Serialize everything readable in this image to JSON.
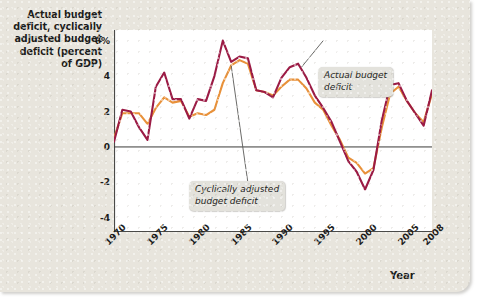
{
  "axes": {
    "y_title": "Actual budget deficit, cyclically adjusted budget deficit (percent of GDP)",
    "y_ticks": [
      "6%",
      "4",
      "2",
      "0",
      "-2",
      "-4"
    ],
    "x_title": "Year",
    "x_ticks": [
      "1970",
      "1975",
      "1980",
      "1985",
      "1990",
      "1995",
      "2000",
      "2005",
      "2008"
    ]
  },
  "annotations": {
    "actual": "Actual budget\ndeficit",
    "cyclical": "Cyclically adjusted\nbudget deficit"
  },
  "colors": {
    "actual": "#9B1B45",
    "cyclical": "#E8913A",
    "background": "#e8e5dd",
    "plot": "#ffffff",
    "axis": "#4a4a48",
    "callout_bg": "#e3e2dc",
    "text": "#1d1d1b"
  },
  "chart_data": {
    "type": "line",
    "title": "",
    "xlabel": "Year",
    "ylabel": "Actual budget deficit, cyclically adjusted budget deficit (percent of GDP)",
    "xlim": [
      1970,
      2008
    ],
    "ylim": [
      -4.8,
      6.6
    ],
    "yticks": [
      -4,
      -2,
      0,
      2,
      4,
      6
    ],
    "xticks": [
      1970,
      1975,
      1980,
      1985,
      1990,
      1995,
      2000,
      2005,
      2008
    ],
    "grid": false,
    "legend": "annotated-callouts",
    "x": [
      1970,
      1971,
      1972,
      1973,
      1974,
      1975,
      1976,
      1977,
      1978,
      1979,
      1980,
      1981,
      1982,
      1983,
      1984,
      1985,
      1986,
      1987,
      1988,
      1989,
      1990,
      1991,
      1992,
      1993,
      1994,
      1995,
      1996,
      1997,
      1998,
      1999,
      2000,
      2001,
      2002,
      2003,
      2004,
      2005,
      2006,
      2007,
      2008
    ],
    "series": [
      {
        "name": "Actual budget deficit",
        "color": "#9B1B45",
        "values": [
          0.3,
          2.1,
          2.0,
          1.1,
          0.4,
          3.4,
          4.2,
          2.7,
          2.7,
          1.6,
          2.7,
          2.6,
          4.0,
          6.0,
          4.8,
          5.1,
          5.0,
          3.2,
          3.1,
          2.8,
          3.9,
          4.5,
          4.7,
          3.9,
          2.9,
          2.2,
          1.4,
          0.3,
          -0.8,
          -1.4,
          -2.4,
          -1.3,
          1.5,
          3.5,
          3.6,
          2.6,
          1.9,
          1.2,
          3.2
        ]
      },
      {
        "name": "Cyclically adjusted budget deficit",
        "color": "#E8913A",
        "values": [
          0.5,
          1.9,
          1.9,
          1.9,
          1.3,
          2.2,
          2.8,
          2.5,
          2.6,
          1.7,
          1.9,
          1.8,
          2.1,
          3.6,
          4.6,
          4.9,
          4.7,
          3.2,
          3.1,
          2.9,
          3.4,
          3.8,
          3.8,
          3.3,
          2.5,
          2.1,
          1.2,
          0.4,
          -0.6,
          -0.9,
          -1.5,
          -1.2,
          1.1,
          3.0,
          3.4,
          2.6,
          1.9,
          1.4,
          3.0
        ]
      }
    ]
  }
}
